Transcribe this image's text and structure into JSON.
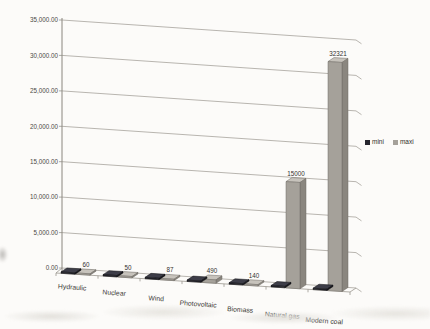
{
  "chart_data": {
    "type": "bar",
    "projection": "3d-clustered-column",
    "title": "",
    "xlabel": "",
    "ylabel": "",
    "categories": [
      "Hydraulic",
      "Nuclear",
      "Wind",
      "Photovoltaic",
      "Biomass",
      "Natural gas",
      "Modern coal"
    ],
    "series": [
      {
        "name": "mini",
        "values": [
          null,
          null,
          null,
          null,
          null,
          null,
          null
        ],
        "values_labeled": false,
        "color": {
          "front": "#26262e",
          "side": "#15151b",
          "top": "#3d3d48",
          "stroke": "#0f0f13"
        }
      },
      {
        "name": "maxi",
        "values": [
          60,
          50,
          87,
          490,
          140,
          15000,
          32321
        ],
        "values_labeled": true,
        "color": {
          "front": "#a5a19a",
          "side": "#8a867f",
          "top": "#c7c3bc",
          "stroke": "#6e6a64"
        }
      }
    ],
    "ylim": [
      0,
      35000
    ],
    "y_tick_step": 5000,
    "y_tick_labels": [
      "35,000.00",
      "30,000.00",
      "25,000.00",
      "20,000.00",
      "15,000.00",
      "10,000.00",
      "5,000.00",
      "0.00"
    ],
    "grid": true,
    "legend": {
      "position": "right-middle",
      "entries": [
        "mini",
        "maxi"
      ]
    }
  },
  "colors": {
    "background": "#fcfbf9",
    "gridline": "#9b978f",
    "axis": "#8a867f",
    "tick_text": "#4c4a46",
    "value_label_text": "#33312e",
    "category_text": "#3b3935",
    "legend_text": "#2e2c29"
  }
}
